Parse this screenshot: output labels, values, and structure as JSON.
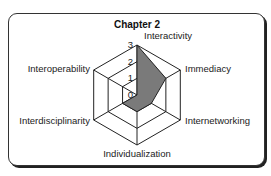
{
  "chart_data": {
    "type": "radar",
    "title": "Chapter 2",
    "categories": [
      "Interactivity",
      "Immediacy",
      "Internetworking",
      "Individualization",
      "Interdisciplinarity",
      "Interoperability"
    ],
    "values": [
      3,
      2,
      1,
      1,
      1,
      0
    ],
    "rlim": [
      0,
      3
    ],
    "tick_labels": [
      "0",
      "1",
      "2",
      "3"
    ],
    "grid": true,
    "fill_color": "#7a7a7a",
    "line_color": "#222222"
  }
}
